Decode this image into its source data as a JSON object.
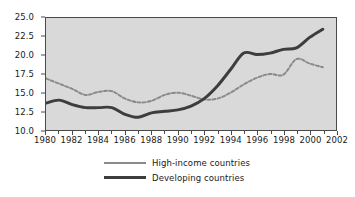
{
  "chart_data": {
    "type": "line",
    "title": "",
    "subtitle": "",
    "xlabel": "",
    "ylabel": "",
    "xlim": [
      1980,
      2002
    ],
    "ylim": [
      10.0,
      25.0
    ],
    "grid": false,
    "legend_position": "bottom",
    "y_ticks": [
      "25.0",
      "22.5",
      "20.0",
      "17.5",
      "15.0",
      "12.5",
      "10.0"
    ],
    "y_tick_values": [
      25.0,
      22.5,
      20.0,
      17.5,
      15.0,
      12.5,
      10.0
    ],
    "x_ticks": [
      "1980",
      "1982",
      "1984",
      "1986",
      "1988",
      "1990",
      "1992",
      "1994",
      "1996",
      "1998",
      "2000",
      "2002"
    ],
    "x_tick_values": [
      1980,
      1982,
      1984,
      1986,
      1988,
      1990,
      1992,
      1994,
      1996,
      1998,
      2000,
      2002
    ],
    "x_minor_tick_values": [
      1981,
      1983,
      1985,
      1987,
      1989,
      1991,
      1993,
      1995,
      1997,
      1999,
      2001
    ],
    "x": [
      1980,
      1981,
      1982,
      1983,
      1984,
      1985,
      1986,
      1987,
      1988,
      1989,
      1990,
      1991,
      1992,
      1993,
      1994,
      1995,
      1996,
      1997,
      1998,
      1999,
      2000,
      2001
    ],
    "series": [
      {
        "name": "High-income countries",
        "style": "dashed",
        "color": "#8a8a8a",
        "values": [
          16.9,
          16.2,
          15.5,
          14.7,
          15.1,
          15.2,
          14.2,
          13.7,
          13.9,
          14.7,
          15.0,
          14.6,
          14.1,
          14.2,
          15.0,
          16.1,
          17.0,
          17.5,
          17.4,
          19.5,
          18.9,
          18.4
        ]
      },
      {
        "name": "Developing countries",
        "style": "solid",
        "color": "#3d3d3d",
        "values": [
          13.6,
          14.0,
          13.4,
          13.0,
          13.0,
          13.0,
          12.1,
          11.7,
          12.3,
          12.5,
          12.7,
          13.2,
          14.2,
          15.9,
          18.1,
          20.3,
          20.1,
          20.3,
          20.8,
          21.0,
          22.4,
          23.5
        ]
      }
    ]
  },
  "legend": {
    "items": [
      {
        "label": "High-income countries"
      },
      {
        "label": "Developing countries"
      }
    ]
  }
}
